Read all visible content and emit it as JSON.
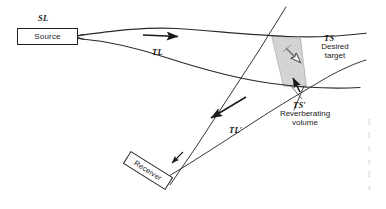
{
  "figure": {
    "type": "acoustic-propagation-diagram",
    "background_color": "#ffffff",
    "line_color": "#222222",
    "shade_color": "#d4d4d4",
    "width": 386,
    "height": 209
  },
  "boxes": {
    "source": {
      "label": "Source",
      "annotation": "SL"
    },
    "receiver": {
      "label": "Receiver",
      "rotation_deg": 32
    }
  },
  "labels": {
    "sl": "SL",
    "tl_upper": "TL",
    "tl_lower": "TL′",
    "ts": "TS",
    "ts_prime": "TS′",
    "desired_target_line1": "Desired",
    "desired_target_line2": "target",
    "reverberating_line1": "Reverberating",
    "reverberating_line2": "volume"
  },
  "margin_artifact": {
    "lines": [
      "l",
      "l",
      "i",
      "r",
      "l",
      "s"
    ]
  },
  "annotations": {
    "forward_arrow": "arrow pointing right along outgoing ray path",
    "return_arrow": "arrow pointing down-left along return ray path",
    "target_arrow": "arrow pointing up into the shaded target volume",
    "leader_line": "leader from TS-prime label to ray intersection point"
  }
}
